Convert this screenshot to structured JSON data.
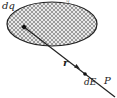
{
  "diagram": {
    "labels": {
      "charge_element": "dq",
      "displacement": "r",
      "field_element": "dE",
      "field_point": "P",
      "body_label_partial": "q"
    },
    "colors": {
      "stroke": "#222222",
      "hatch": "#555555",
      "fill": "#e6e6e6",
      "background": "#ffffff"
    }
  }
}
